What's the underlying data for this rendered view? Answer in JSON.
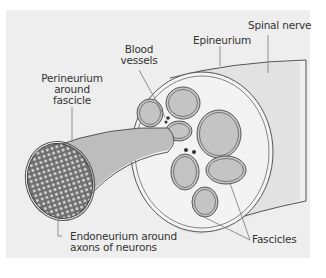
{
  "diagram": {
    "labels": {
      "spinal_nerve": "Spinal nerve",
      "epineurium": "Epineurium",
      "blood_vessels_line1": "Blood",
      "blood_vessels_line2": "vessels",
      "perineurium_line1": "Perineurium",
      "perineurium_line2": "around",
      "perineurium_line3": "fascicle",
      "endoneurium_line1": "Endoneurium around",
      "endoneurium_line2": "axons of neurons",
      "fascicles": "Fascicles"
    },
    "colors": {
      "background_panel": "#eeeeee",
      "nerve_trunk": "#e2e2e2",
      "cross_section_fill": "#f3f3f3",
      "fascicle_fill": "#c4c4c4",
      "fascicle_tube": "#bdbdbd",
      "outline": "#555555",
      "axon_bundle": "#777777",
      "axon_dot": "#dddddd"
    },
    "components": [
      "Spinal nerve",
      "Epineurium",
      "Blood vessels",
      "Perineurium around fascicle",
      "Endoneurium around axons of neurons",
      "Fascicles"
    ]
  }
}
